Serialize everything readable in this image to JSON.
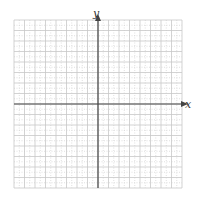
{
  "diagram": {
    "type": "coordinate-plane",
    "x_axis_label": "x",
    "y_axis_label": "y",
    "grid": {
      "cols": 16,
      "rows": 16,
      "left": 14,
      "top": 20,
      "cell": 10.5,
      "minor_subdivisions": 2
    },
    "origin": {
      "px_x": 98,
      "px_y": 104
    },
    "colors": {
      "major_grid": "#c8c8c8",
      "minor_grid": "#d8d8d8",
      "axis": "#444444"
    }
  }
}
